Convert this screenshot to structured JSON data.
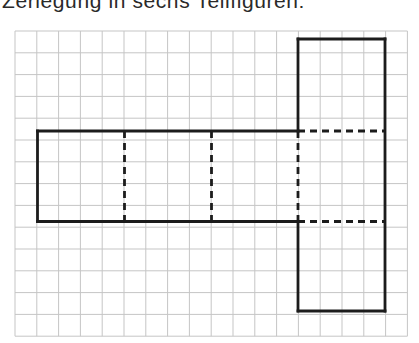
{
  "title": {
    "text": "Zerlegung in sechs Teilfiguren:"
  },
  "diagram": {
    "canvas": {
      "width": 419,
      "height": 343
    },
    "colors": {
      "background": "#ffffff",
      "grid_line": "#c5c5c5",
      "net_line": "#1c1c1c",
      "title_text": "#2a2a2a"
    },
    "grid": {
      "x": 15,
      "y": 31,
      "cols": 18,
      "rows": 14,
      "cell": 21.8,
      "line_width": 1
    },
    "net": {
      "stroke_width": 2.8,
      "dash_pattern": "7 5",
      "figures_count": 6,
      "squares": [
        {
          "name": "strip-square-1",
          "x": 37.5,
          "y": 131,
          "w": 87,
          "h": 90.5
        },
        {
          "name": "strip-square-2",
          "x": 124.5,
          "y": 131,
          "w": 87,
          "h": 90.5
        },
        {
          "name": "strip-square-3",
          "x": 211.5,
          "y": 131,
          "w": 86.5,
          "h": 90.5
        },
        {
          "name": "column-square-top",
          "x": 298,
          "y": 39,
          "w": 87,
          "h": 92
        },
        {
          "name": "column-square-middle",
          "x": 298,
          "y": 131,
          "w": 87,
          "h": 90.5
        },
        {
          "name": "column-square-bottom",
          "x": 298,
          "y": 221.5,
          "w": 87,
          "h": 89.5
        }
      ],
      "solid_segments": [
        [
          37.5,
          131,
          298,
          131
        ],
        [
          37.5,
          221.5,
          298,
          221.5
        ],
        [
          37.5,
          131,
          37.5,
          221.5
        ],
        [
          298,
          39,
          385,
          39
        ],
        [
          385,
          39,
          385,
          311
        ],
        [
          298,
          311,
          385,
          311
        ],
        [
          298,
          39,
          298,
          131
        ],
        [
          298,
          221.5,
          298,
          311
        ]
      ],
      "dashed_segments": [
        [
          124.5,
          131,
          124.5,
          221.5
        ],
        [
          211.5,
          131,
          211.5,
          221.5
        ],
        [
          298,
          131,
          298,
          221.5
        ],
        [
          298,
          131,
          385,
          131
        ],
        [
          298,
          221.5,
          385,
          221.5
        ]
      ]
    }
  }
}
